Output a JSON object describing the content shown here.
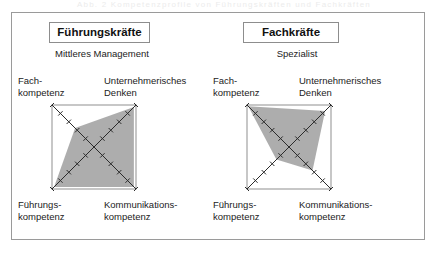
{
  "figure": {
    "ghost_caption": "Abb. 2  Kompetenzprofile von Führungskräften und Fachkräften",
    "frame_color": "#9a9a9a",
    "polygon_fill": "#a9a9a9",
    "axis_color": "#2b2b2b"
  },
  "panels": [
    {
      "id": "fuehrungskraefte",
      "title": "Führungskräfte",
      "subtitle": "Mittleres\nManagement",
      "axes": {
        "top_left": "Fach-\nkompetenz",
        "top_right": "Unternehmerisches\nDenken",
        "bottom_left": "Führungs-\nkompetenz",
        "bottom_right": "Kommunikations-\nkompetenz"
      },
      "chart_data": {
        "type": "radar",
        "categories": [
          "Fachkompetenz",
          "Unternehmerisches Denken",
          "Kommunikationskompetenz",
          "Führungskompetenz"
        ],
        "values": [
          0.45,
          0.95,
          0.95,
          0.95
        ],
        "ticks_per_axis": 5,
        "range": [
          0,
          1
        ],
        "title": "Führungskräfte",
        "grid": false,
        "legend": "none"
      }
    },
    {
      "id": "fachkraefte",
      "title": "Fachkräfte",
      "subtitle": "Spezialist",
      "axes": {
        "top_left": "Fach-\nkompetenz",
        "top_right": "Unternehmerisches\nDenken",
        "bottom_left": "Führungs-\nkompetenz",
        "bottom_right": "Kommunikations-\nkompetenz"
      },
      "chart_data": {
        "type": "radar",
        "categories": [
          "Fachkompetenz",
          "Unternehmerisches Denken",
          "Kommunikationskompetenz",
          "Führungskompetenz"
        ],
        "values": [
          0.97,
          0.86,
          0.56,
          0.3
        ],
        "ticks_per_axis": 5,
        "range": [
          0,
          1
        ],
        "title": "Fachkräfte",
        "grid": false,
        "legend": "none"
      }
    }
  ]
}
